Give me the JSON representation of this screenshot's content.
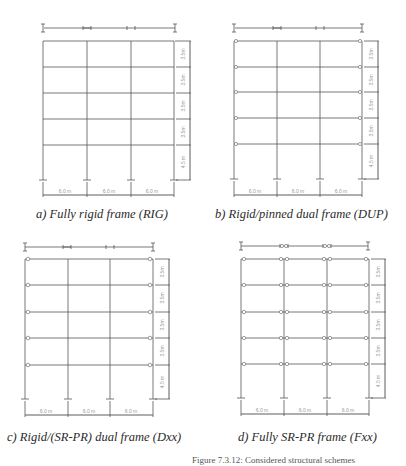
{
  "figure": {
    "caption": "Figure 7.3.12: Considered structural schemes",
    "panels": [
      {
        "id": "a",
        "caption": "a) Fully rigid frame (RIG)",
        "type": "RIG"
      },
      {
        "id": "b",
        "caption": "b) Rigid/pinned dual frame (DUP)",
        "type": "DUP"
      },
      {
        "id": "c",
        "caption": "c) Rigid/(SR-PR) dual frame (Dxx)",
        "type": "Dxx"
      },
      {
        "id": "d",
        "caption": "d) Fully SR-PR frame (Fxx)",
        "type": "Fxx"
      }
    ],
    "dimensions": {
      "bay_labels": [
        "6.0 m",
        "6.0 m",
        "6.0 m"
      ],
      "storey_labels": [
        "3.5m",
        "3.5m",
        "3.5m",
        "3.5m",
        "4.5 m"
      ]
    },
    "colors": {
      "line": "#555555",
      "dim_line": "#333333",
      "dim_text": "#999999"
    }
  }
}
